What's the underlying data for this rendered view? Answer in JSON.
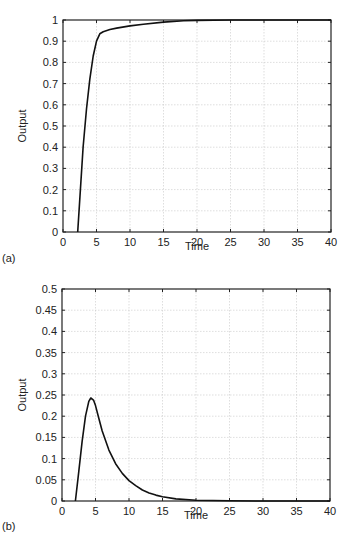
{
  "chart_data": [
    {
      "panel_label": "(a)",
      "type": "line",
      "title": "",
      "xlabel": "Time",
      "ylabel": "Output",
      "xlim": [
        0,
        40
      ],
      "ylim": [
        0,
        1
      ],
      "grid": true,
      "legend": null,
      "x_ticks": [
        "0",
        "5",
        "10",
        "15",
        "20",
        "25",
        "30",
        "35",
        "40"
      ],
      "y_ticks": [
        "0",
        "0.1",
        "0.2",
        "0.3",
        "0.4",
        "0.5",
        "0.6",
        "0.7",
        "0.8",
        "0.9",
        "1"
      ],
      "series": [
        {
          "name": "Output",
          "x": [
            2.2,
            2.6,
            3.0,
            3.5,
            4.0,
            4.5,
            5.0,
            5.5,
            6.0,
            7.0,
            8.0,
            10.0,
            12.0,
            15.0,
            18.0,
            20.0,
            25.0,
            30.0,
            35.0,
            40.0
          ],
          "y": [
            0.0,
            0.2,
            0.4,
            0.58,
            0.72,
            0.83,
            0.9,
            0.935,
            0.945,
            0.955,
            0.962,
            0.972,
            0.98,
            0.99,
            0.996,
            0.998,
            1.0,
            1.0,
            1.0,
            1.0
          ]
        }
      ]
    },
    {
      "panel_label": "(b)",
      "type": "line",
      "title": "",
      "xlabel": "Time",
      "ylabel": "Output",
      "xlim": [
        0,
        40
      ],
      "ylim": [
        0,
        0.5
      ],
      "grid": true,
      "legend": null,
      "x_ticks": [
        "0",
        "5",
        "10",
        "15",
        "20",
        "25",
        "30",
        "35",
        "40"
      ],
      "y_ticks": [
        "0",
        "0.05",
        "0.1",
        "0.15",
        "0.2",
        "0.25",
        "0.3",
        "0.35",
        "0.4",
        "0.45",
        "0.5"
      ],
      "series": [
        {
          "name": "Output",
          "x": [
            2.0,
            2.5,
            3.0,
            3.5,
            4.0,
            4.3,
            4.7,
            5.0,
            5.5,
            6.0,
            7.0,
            8.0,
            9.0,
            10.0,
            11.0,
            12.0,
            13.0,
            14.0,
            15.0,
            17.0,
            20.0,
            25.0,
            30.0,
            35.0,
            40.0
          ],
          "y": [
            0.0,
            0.07,
            0.14,
            0.2,
            0.235,
            0.243,
            0.238,
            0.225,
            0.195,
            0.165,
            0.12,
            0.088,
            0.065,
            0.048,
            0.036,
            0.026,
            0.019,
            0.014,
            0.01,
            0.005,
            0.002,
            0.0005,
            0.0,
            0.0,
            0.0
          ]
        }
      ]
    }
  ]
}
